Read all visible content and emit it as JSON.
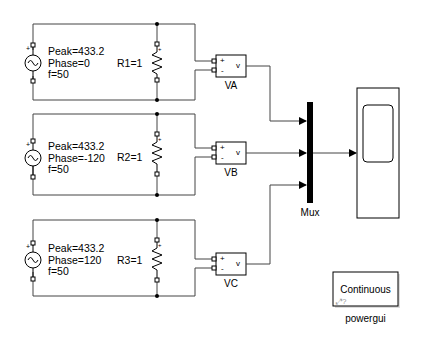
{
  "diagram": {
    "type": "simulink-model",
    "sources": [
      {
        "peak_label": "Peak=433.2",
        "phase_label": "Phase=0",
        "freq_label": "f=50",
        "resistor_label": "R1=1"
      },
      {
        "peak_label": "Peak=433.2",
        "phase_label": "Phase=-120",
        "freq_label": "f=50",
        "resistor_label": "R2=1"
      },
      {
        "peak_label": "Peak=433.2",
        "phase_label": "Phase=120",
        "freq_label": "f=50",
        "resistor_label": "R3=1"
      }
    ],
    "voltmeters": [
      {
        "name": "VA",
        "plus": "+",
        "minus": "-",
        "out": "v"
      },
      {
        "name": "VB",
        "plus": "+",
        "minus": "-",
        "out": "v"
      },
      {
        "name": "VC",
        "plus": "+",
        "minus": "-",
        "out": "v"
      }
    ],
    "mux": {
      "name": "Mux",
      "inputs": 3
    },
    "scope": {
      "name": ""
    },
    "powergui": {
      "text": "Continuous",
      "name": "powergui"
    }
  }
}
